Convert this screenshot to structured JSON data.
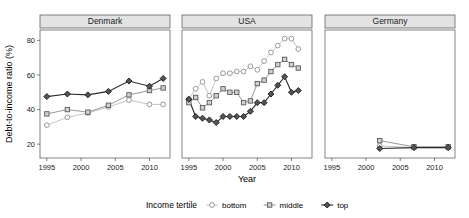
{
  "chart_data": {
    "type": "line",
    "title": "",
    "xlabel": "Year",
    "ylabel": "Debt-to-income ratio (%)",
    "xlim": [
      1994,
      2013
    ],
    "ylim": [
      12,
      86
    ],
    "yticks": [
      20,
      40,
      60,
      80
    ],
    "xticks": [
      1995,
      2000,
      2005,
      2010
    ],
    "grid": false,
    "legend": {
      "title": "Income tertile",
      "position": "bottom",
      "entries": [
        {
          "name": "bottom",
          "marker": "open-circle",
          "color": "#bdbdbd"
        },
        {
          "name": "middle",
          "marker": "open-square",
          "color": "#8c8c8c"
        },
        {
          "name": "top",
          "marker": "filled-diamond",
          "color": "#2b2b2b"
        }
      ]
    },
    "facet_variable": "country",
    "panels": [
      {
        "label": "Denmark",
        "x": [
          1995,
          1998,
          2001,
          2004,
          2007,
          2010,
          2012
        ],
        "series": [
          {
            "name": "bottom",
            "values": [
              31,
              35.5,
              38,
              41.5,
              45.5,
              43,
              43
            ]
          },
          {
            "name": "middle",
            "values": [
              37.5,
              40,
              38.5,
              42.5,
              48.5,
              51,
              52.5
            ]
          },
          {
            "name": "top",
            "values": [
              47.5,
              49,
              48.5,
              50.5,
              56.5,
              53.5,
              58
            ]
          }
        ]
      },
      {
        "label": "USA",
        "x": [
          1995,
          1996,
          1997,
          1998,
          1999,
          2000,
          2001,
          2002,
          2003,
          2004,
          2005,
          2006,
          2007,
          2008,
          2009,
          2010,
          2011
        ],
        "series": [
          {
            "name": "bottom",
            "values": [
              46,
              52,
              56,
              48,
              58,
              61,
              61,
              62,
              62,
              65,
              63,
              68,
              73,
              77,
              81,
              81,
              75
            ]
          },
          {
            "name": "middle",
            "values": [
              44,
              47,
              41,
              44,
              48,
              52,
              50,
              50,
              44,
              45,
              55,
              57,
              62,
              66,
              69,
              66,
              64
            ]
          },
          {
            "name": "top",
            "values": [
              46,
              36,
              35,
              34,
              32.5,
              36,
              36,
              36,
              36,
              39,
              44,
              44,
              49,
              54,
              59,
              50,
              51
            ]
          }
        ]
      },
      {
        "label": "Germany",
        "x": [
          2002,
          2007,
          2012
        ],
        "series": [
          {
            "name": "bottom",
            "values": [
              19,
              18,
              18
            ]
          },
          {
            "name": "middle",
            "values": [
              22,
              18.5,
              18.5
            ]
          },
          {
            "name": "top",
            "values": [
              17.5,
              18,
              18
            ]
          }
        ]
      }
    ]
  }
}
